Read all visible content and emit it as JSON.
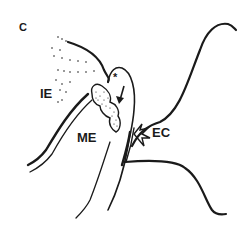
{
  "figure": {
    "panel_label": "C",
    "labels": {
      "inner_ear": "IE",
      "middle_ear": "ME",
      "external_canal": "EC",
      "asterisk": "*"
    },
    "colors": {
      "line": "#1a1a1a",
      "background": "#ffffff"
    }
  }
}
